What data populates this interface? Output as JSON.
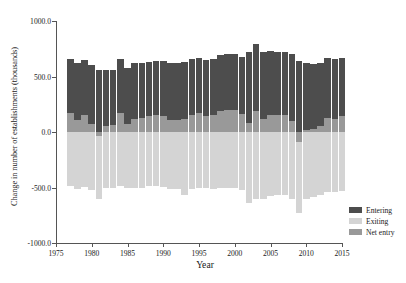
{
  "chart_data": {
    "type": "bar",
    "stacked": true,
    "title": "",
    "xlabel": "Year",
    "ylabel": "Change in number of establishments (thousands)",
    "xlim": [
      1975,
      2015
    ],
    "ylim": [
      -1000.0,
      1000.0
    ],
    "xticks": [
      1975,
      1980,
      1985,
      1990,
      1995,
      2000,
      2005,
      2010,
      2015
    ],
    "xtick_labels": [
      "1975",
      "1980",
      "1985",
      "1990",
      "1995",
      "2000",
      "2005",
      "2010",
      "2015"
    ],
    "yticks": [
      1000.0,
      500.0,
      0.0,
      -500.0,
      -1000.0
    ],
    "ytick_labels": [
      "1000.0",
      "500.0",
      "0.0",
      "-500.0",
      "-1000.0"
    ],
    "grid": false,
    "legend_position": "right",
    "categories": [
      1977,
      1978,
      1979,
      1980,
      1981,
      1982,
      1983,
      1984,
      1985,
      1986,
      1987,
      1988,
      1989,
      1990,
      1991,
      1992,
      1993,
      1994,
      1995,
      1996,
      1997,
      1998,
      1999,
      2000,
      2001,
      2002,
      2003,
      2004,
      2005,
      2006,
      2007,
      2008,
      2009,
      2010,
      2011,
      2012,
      2013,
      2014,
      2015
    ],
    "series": [
      {
        "name": "Entering",
        "color": "#4d4d4d",
        "values": [
          660,
          620,
          645,
          600,
          560,
          560,
          560,
          660,
          580,
          620,
          625,
          630,
          640,
          640,
          620,
          620,
          630,
          660,
          670,
          650,
          660,
          690,
          700,
          700,
          680,
          720,
          790,
          720,
          730,
          720,
          720,
          700,
          640,
          620,
          615,
          620,
          670,
          655,
          670
        ]
      },
      {
        "name": "Net entry",
        "color": "#999999",
        "values": [
          175,
          110,
          150,
          75,
          -40,
          55,
          60,
          170,
          75,
          120,
          125,
          140,
          150,
          145,
          110,
          105,
          120,
          150,
          170,
          145,
          150,
          190,
          200,
          195,
          160,
          80,
          185,
          120,
          155,
          150,
          150,
          95,
          -90,
          15,
          25,
          55,
          125,
          115,
          140
        ]
      },
      {
        "name": "Exiting",
        "color": "#d4d4d4",
        "values": [
          -485,
          -510,
          -495,
          -525,
          -600,
          -505,
          -500,
          -490,
          -505,
          -500,
          -500,
          -490,
          -490,
          -495,
          -510,
          -515,
          -570,
          -510,
          -500,
          -505,
          -510,
          -500,
          -500,
          -505,
          -520,
          -640,
          -605,
          -600,
          -575,
          -570,
          -570,
          -605,
          -730,
          -605,
          -590,
          -565,
          -545,
          -540,
          -530
        ]
      }
    ],
    "legend": [
      {
        "label": "Entering",
        "color": "#4d4d4d"
      },
      {
        "label": "Exiting",
        "color": "#d4d4d4"
      },
      {
        "label": "Net entry",
        "color": "#999999"
      }
    ]
  }
}
